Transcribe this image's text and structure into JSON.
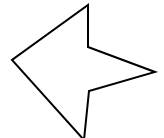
{
  "canvas": {
    "width": 164,
    "height": 138,
    "background_color": "#ffffff",
    "description": "concave-polygon-outline"
  },
  "shape": {
    "name": "arrow-star-polygon",
    "kind": "polygon",
    "closed": true,
    "fill_color": "#ffffff",
    "stroke_color": "#000000",
    "stroke_width": 2,
    "stroke_linejoin": "miter",
    "vertex_count": 6,
    "points": "88,5 88,47 155,72 89,91 84,140 12,60",
    "vertices": [
      {
        "label": "top-apex",
        "x": 88,
        "y": 5,
        "type": "convex"
      },
      {
        "label": "upper-notch",
        "x": 88,
        "y": 47,
        "type": "concave"
      },
      {
        "label": "right-tip",
        "x": 155,
        "y": 72,
        "type": "convex"
      },
      {
        "label": "lower-notch",
        "x": 89,
        "y": 91,
        "type": "concave"
      },
      {
        "label": "bottom-apex",
        "x": 84,
        "y": 140,
        "type": "convex"
      },
      {
        "label": "left-vertex",
        "x": 12,
        "y": 60,
        "type": "convex"
      }
    ]
  }
}
